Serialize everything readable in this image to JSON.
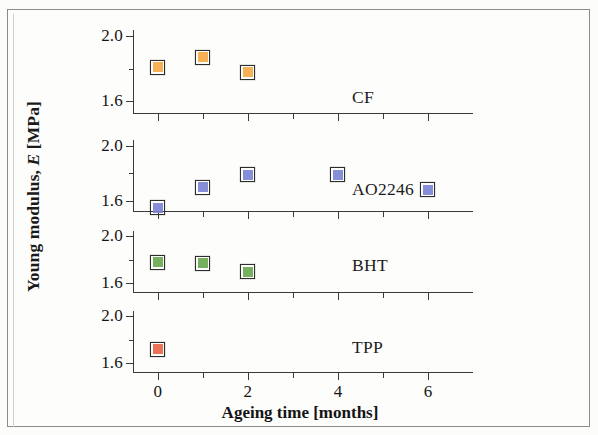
{
  "figure": {
    "background_color": "#fdfdfb",
    "axis_color": "#3a3a3a"
  },
  "axes": {
    "y_title_prefix": "Young modulus, ",
    "y_title_italic": "E",
    "y_title_suffix": " [MPa]",
    "x_title": "Ageing time [months]",
    "y_major_labels": [
      "2.0",
      "1.6"
    ],
    "x_major_labels": [
      "0",
      "2",
      "4",
      "6"
    ]
  },
  "chart_data": {
    "type": "scatter",
    "title": "",
    "xlabel": "Ageing time [months]",
    "ylabel": "Young modulus, E [MPa]",
    "xlim": [
      -0.55,
      7.0
    ],
    "ylim": [
      1.52,
      2.04
    ],
    "y_major_ticks": [
      2.0,
      1.6
    ],
    "y_minor_ticks": [
      1.8
    ],
    "x_major_ticks": [
      0,
      2,
      4,
      6
    ],
    "x_minor_ticks": [
      1,
      3,
      5
    ],
    "grid": false,
    "legend_position": "right-of-panel",
    "panels": [
      {
        "name": "CF",
        "label": "CF",
        "color": "#f5a947",
        "edge_color": "#2d2d2d",
        "marker": "square",
        "x": [
          0,
          1,
          2
        ],
        "y": [
          1.81,
          1.87,
          1.78
        ]
      },
      {
        "name": "AO2246",
        "label": "AO2246",
        "color": "#7b84d4",
        "edge_color": "#2d2d2d",
        "marker": "square",
        "x": [
          0,
          1,
          2,
          4,
          6
        ],
        "y": [
          1.55,
          1.7,
          1.79,
          1.79,
          1.68
        ]
      },
      {
        "name": "BHT",
        "label": "BHT",
        "color": "#6aa84f",
        "edge_color": "#2d2d2d",
        "marker": "square",
        "x": [
          0,
          1,
          2
        ],
        "y": [
          1.78,
          1.77,
          1.7
        ]
      },
      {
        "name": "TPP",
        "label": "TPP",
        "color": "#e8674a",
        "edge_color": "#2d2d2d",
        "marker": "square",
        "x": [
          0
        ],
        "y": [
          1.72
        ]
      }
    ]
  },
  "layout": {
    "panel_tops": [
      30,
      140,
      231,
      311
    ],
    "panel_heights": [
      84,
      72,
      62,
      62
    ],
    "panel_label_tops": [
      87,
      179,
      255,
      337
    ]
  }
}
